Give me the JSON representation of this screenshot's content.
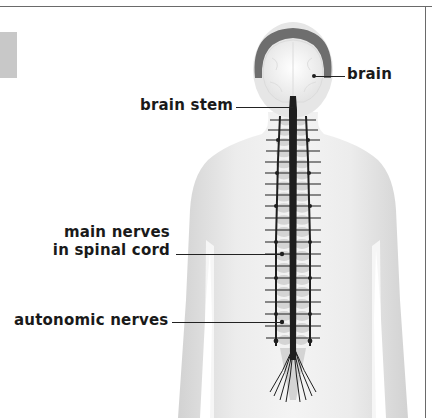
{
  "diagram": {
    "labels": {
      "brain": "brain",
      "brain_stem": "brain stem",
      "main_nerves_line1": "main nerves",
      "main_nerves_line2": "in spinal cord",
      "autonomic_nerves": "autonomic nerves"
    },
    "colors": {
      "skin": "#e4e4e4",
      "hair": "#6e6e6e",
      "brain": "#f6f6f6",
      "nerves": "#1e1e1e",
      "vertebrae": "#d6d6d6",
      "frame": "#6a6a6a",
      "tab": "#c8c8c8"
    }
  }
}
